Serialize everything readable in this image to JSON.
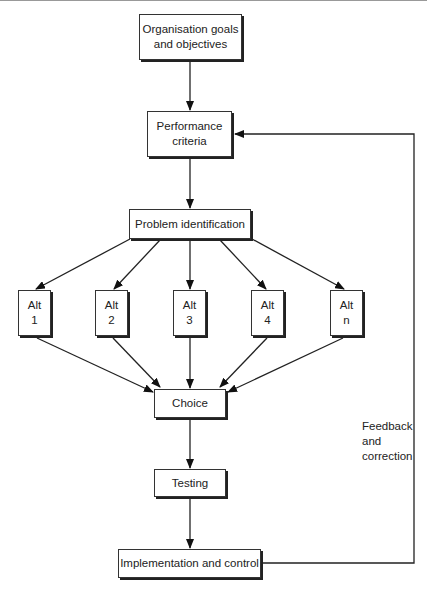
{
  "diagram": {
    "type": "flowchart",
    "nodes": {
      "goals": "Organisation goals\nand objectives",
      "criteria": "Performance\ncriteria",
      "problem": "Problem identification",
      "alt1": "Alt\n1",
      "alt2": "Alt\n2",
      "alt3": "Alt\n3",
      "alt4": "Alt\n4",
      "altn": "Alt\nn",
      "choice": "Choice",
      "testing": "Testing",
      "implementation": "Implementation and control"
    },
    "feedback_label": "Feedback\nand\ncorrection",
    "edges": [
      [
        "goals",
        "criteria"
      ],
      [
        "criteria",
        "problem"
      ],
      [
        "problem",
        "alt1"
      ],
      [
        "problem",
        "alt2"
      ],
      [
        "problem",
        "alt3"
      ],
      [
        "problem",
        "alt4"
      ],
      [
        "problem",
        "altn"
      ],
      [
        "alt1",
        "choice"
      ],
      [
        "alt2",
        "choice"
      ],
      [
        "alt3",
        "choice"
      ],
      [
        "alt4",
        "choice"
      ],
      [
        "altn",
        "choice"
      ],
      [
        "choice",
        "testing"
      ],
      [
        "testing",
        "implementation"
      ],
      [
        "implementation",
        "criteria",
        "Feedback and correction"
      ]
    ]
  }
}
